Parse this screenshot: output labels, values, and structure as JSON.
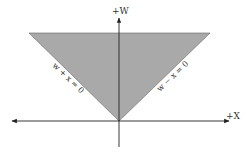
{
  "diagram": {
    "axes": {
      "vertical_label": "+W",
      "horizontal_label": "+X"
    },
    "lines": {
      "left_label": "w + x = 0",
      "right_label": "w − x = 0"
    },
    "colors": {
      "region_fill": "#a9a9a9",
      "axis": "#222222",
      "boundary": "#555555"
    }
  }
}
